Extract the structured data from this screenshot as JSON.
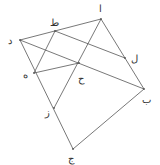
{
  "diagram": {
    "type": "geometric-figure",
    "points": [
      {
        "id": "alif",
        "label": "ا",
        "x": 101,
        "y": 19,
        "lx": 99,
        "ly": 12
      },
      {
        "id": "ba",
        "label": "ب",
        "x": 144,
        "y": 89,
        "lx": 142,
        "ly": 103
      },
      {
        "id": "jim",
        "label": "ج",
        "x": 73,
        "y": 149,
        "lx": 68,
        "ly": 162
      },
      {
        "id": "dal",
        "label": "د",
        "x": 20,
        "y": 40,
        "lx": 8,
        "ly": 44
      },
      {
        "id": "ha",
        "label": "ه",
        "x": 34,
        "y": 73,
        "lx": 23,
        "ly": 78
      },
      {
        "id": "zay",
        "label": "ز",
        "x": 54,
        "y": 108,
        "lx": 45,
        "ly": 116
      },
      {
        "id": "hha",
        "label": "ح",
        "x": 79,
        "y": 63,
        "lx": 78,
        "ly": 82
      },
      {
        "id": "ta",
        "label": "ط",
        "x": 55,
        "y": 31,
        "lx": 50,
        "ly": 26
      },
      {
        "id": "lam",
        "label": "ل",
        "x": 125,
        "y": 58,
        "lx": 131,
        "ly": 62
      }
    ],
    "segments": [
      [
        "dal",
        "alif"
      ],
      [
        "alif",
        "ba"
      ],
      [
        "ba",
        "jim"
      ],
      [
        "jim",
        "dal"
      ],
      [
        "dal",
        "ba"
      ],
      [
        "alif",
        "zay"
      ],
      [
        "ta",
        "lam"
      ],
      [
        "ta",
        "ha"
      ],
      [
        "ha",
        "hha"
      ]
    ],
    "colors": {
      "line": "#555555",
      "label": "#333333"
    }
  }
}
